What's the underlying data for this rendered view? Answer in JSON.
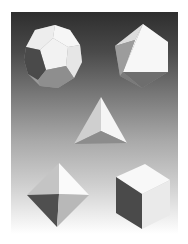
{
  "image": {
    "description": "Five Platonic solids rendered on a vertical dark-to-light gray gradient",
    "background": {
      "top_color": "#2e2e2e",
      "bottom_color": "#ffffff"
    },
    "solids": [
      {
        "name": "dodecahedron",
        "position": "top-left"
      },
      {
        "name": "icosahedron",
        "position": "top-right"
      },
      {
        "name": "tetrahedron",
        "position": "center"
      },
      {
        "name": "octahedron",
        "position": "bottom-left"
      },
      {
        "name": "cube",
        "position": "bottom-right"
      }
    ],
    "colors": {
      "face_light": "#f4f4f4",
      "face_mid": "#c8c8c8",
      "face_shadow": "#8a8a8a",
      "face_dark": "#5a5a5a",
      "face_darkest": "#3c3c3c"
    }
  }
}
